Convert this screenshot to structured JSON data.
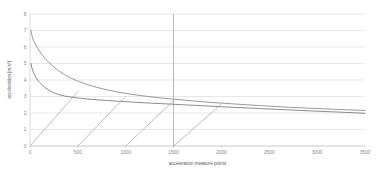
{
  "chart_data": {
    "type": "line",
    "title": "",
    "xlabel": "acceleration measure points",
    "ylabel": "acceleration [m/s²]",
    "xlim": [
      0,
      3500
    ],
    "ylim": [
      0,
      8
    ],
    "xticks": [
      0,
      500,
      1000,
      1500,
      2000,
      2500,
      3000,
      3500
    ],
    "xtick_labels": [
      "0",
      "500",
      "1000",
      "1500",
      "2000",
      "2500",
      "3000",
      "3500"
    ],
    "yticks": [
      0,
      1,
      2,
      3,
      4,
      5,
      6,
      7,
      8
    ],
    "ytick_labels": [
      "0",
      "1",
      "2",
      "3",
      "4",
      "5",
      "6",
      "7",
      "8"
    ],
    "grid": "horizontal",
    "legend": "none",
    "annotations": [
      {
        "name": "vertical-marker",
        "type": "vline",
        "x": 1500,
        "color": "#a6a6a6"
      }
    ],
    "series": [
      {
        "name": "upper-decay-curve",
        "type": "line",
        "color": "#7f7f7f",
        "x": [
          10,
          20,
          40,
          60,
          80,
          100,
          130,
          160,
          200,
          250,
          300,
          360,
          420,
          500,
          600,
          700,
          800,
          900,
          1000,
          1100,
          1250,
          1400,
          1500,
          1700,
          1900,
          2100,
          2400,
          2700,
          3000,
          3250,
          3500
        ],
        "y": [
          7.0,
          6.7,
          6.35,
          6.12,
          5.92,
          5.74,
          5.5,
          5.29,
          5.05,
          4.78,
          4.56,
          4.33,
          4.14,
          3.93,
          3.72,
          3.55,
          3.41,
          3.29,
          3.19,
          3.1,
          2.99,
          2.89,
          2.84,
          2.73,
          2.64,
          2.56,
          2.45,
          2.35,
          2.27,
          2.21,
          2.15
        ]
      },
      {
        "name": "lower-decay-curve",
        "type": "line",
        "color": "#6e6e6e",
        "x": [
          10,
          20,
          40,
          60,
          80,
          100,
          130,
          160,
          200,
          250,
          300,
          360,
          420,
          500,
          600,
          700,
          800,
          900,
          1000,
          1100,
          1250,
          1400,
          1500,
          1700,
          1900,
          2100,
          2400,
          2700,
          3000,
          3250,
          3500
        ],
        "y": [
          5.0,
          4.72,
          4.4,
          4.18,
          4.0,
          3.86,
          3.68,
          3.53,
          3.37,
          3.22,
          3.12,
          3.03,
          2.97,
          2.91,
          2.85,
          2.8,
          2.76,
          2.72,
          2.69,
          2.65,
          2.6,
          2.56,
          2.53,
          2.47,
          2.41,
          2.35,
          2.27,
          2.19,
          2.11,
          2.05,
          1.98
        ]
      },
      {
        "name": "sawtooth-ramps",
        "type": "line",
        "color": "#9a9a9a",
        "description": "repeating ramp segments rising from 0 with period 500 measure points",
        "segments": [
          {
            "x": [
              0,
              500
            ],
            "y": [
              0.0,
              3.3
            ]
          },
          {
            "x": [
              500,
              1000
            ],
            "y": [
              0.0,
              3.0
            ]
          },
          {
            "x": [
              1000,
              1500
            ],
            "y": [
              0.0,
              2.75
            ]
          },
          {
            "x": [
              1500,
              2000
            ],
            "y": [
              0.0,
              2.55
            ]
          }
        ]
      }
    ]
  },
  "geometry": {
    "plot_left": 30,
    "plot_right": 365,
    "plot_top": 14,
    "plot_bottom": 146
  }
}
